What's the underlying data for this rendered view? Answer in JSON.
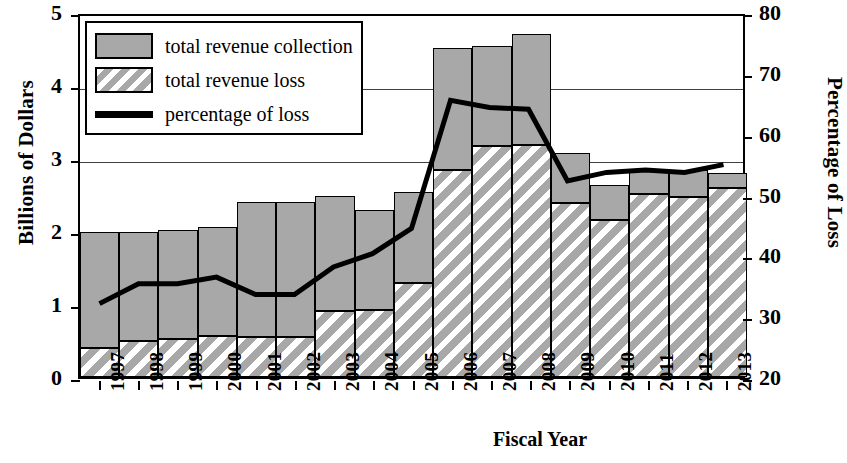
{
  "chart_data": {
    "type": "bar",
    "title": "",
    "xlabel": "Fiscal Year",
    "ylabel": "Billions of Dollars",
    "ylabel_right": "Percentage of Loss",
    "categories": [
      "1997",
      "1998",
      "1999",
      "2000",
      "2001",
      "2002",
      "2003",
      "2004",
      "2005",
      "2006",
      "2007",
      "2008",
      "2009",
      "2010",
      "2011",
      "2012",
      "2013"
    ],
    "ylim": [
      0,
      5
    ],
    "yticks": [
      "0",
      "1",
      "2",
      "3",
      "4",
      "5"
    ],
    "ylim_right": [
      20,
      80
    ],
    "yticks_right": [
      "20",
      "30",
      "40",
      "50",
      "60",
      "70",
      "80"
    ],
    "grid": true,
    "legend_position": "upper-left",
    "series": [
      {
        "name": "total revenue collection",
        "type": "bar-stack-top",
        "color": "#a8a8a8",
        "values": [
          1.58,
          1.49,
          1.5,
          1.49,
          1.85,
          1.85,
          1.57,
          1.37,
          1.25,
          1.67,
          1.37,
          1.52,
          0.69,
          0.48,
          0.33,
          0.37,
          0.21
        ]
      },
      {
        "name": "total revenue loss",
        "type": "bar-stack-bottom",
        "color": "#a8a8a8-hatch",
        "values": [
          0.4,
          0.49,
          0.52,
          0.56,
          0.55,
          0.55,
          0.91,
          0.92,
          1.29,
          2.84,
          3.16,
          3.18,
          2.38,
          2.15,
          2.51,
          2.47,
          2.59
        ]
      },
      {
        "name": "bar totals",
        "type": "bar-total",
        "values": [
          1.98,
          1.98,
          2.02,
          2.05,
          2.4,
          2.4,
          2.48,
          2.29,
          2.54,
          4.51,
          4.53,
          4.7,
          3.07,
          2.63,
          2.84,
          2.84,
          2.8
        ]
      },
      {
        "name": "percentage of loss",
        "type": "line",
        "color": "#000000",
        "values": [
          32.2,
          35.5,
          35.5,
          36.6,
          33.7,
          33.7,
          38.3,
          40.5,
          44.7,
          66.0,
          64.8,
          64.5,
          52.6,
          54.0,
          54.4,
          54.0,
          55.3
        ]
      }
    ]
  },
  "legend": {
    "items": [
      {
        "label": "total revenue collection",
        "icon": "gray-square-swatch"
      },
      {
        "label": "total revenue loss",
        "icon": "hatched-square-swatch"
      },
      {
        "label": "percentage of loss",
        "icon": "black-line-swatch"
      }
    ]
  }
}
